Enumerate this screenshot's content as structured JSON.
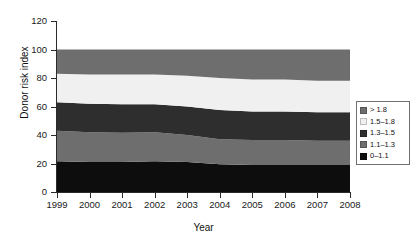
{
  "chart_data": {
    "type": "area",
    "title": "",
    "subtitle": "",
    "xlabel": "Year",
    "ylabel": "Donor risk index",
    "xlim": [
      1999,
      2008
    ],
    "ylim": [
      0,
      120
    ],
    "yticks": [
      0,
      20,
      40,
      60,
      80,
      100,
      120
    ],
    "xticks": [
      1999,
      2000,
      2001,
      2002,
      2003,
      2004,
      2005,
      2006,
      2007,
      2008
    ],
    "grid": false,
    "stacked": true,
    "stack_order": "bottom-to-top",
    "legend_position": "right",
    "x": [
      1999,
      2000,
      2001,
      2002,
      2003,
      2004,
      2005,
      2006,
      2007,
      2008
    ],
    "series": [
      {
        "name": "0–1.1",
        "color": "#0d0d0d",
        "values": [
          21.5,
          21.0,
          21.0,
          21.5,
          21.0,
          19.5,
          19.0,
          19.0,
          19.0,
          19.0
        ]
      },
      {
        "name": "1.1–1.3",
        "color": "#6e6e6e",
        "values": [
          21.5,
          21.0,
          20.5,
          20.5,
          19.0,
          17.5,
          17.5,
          17.5,
          17.0,
          17.0
        ]
      },
      {
        "name": "1.3–1.5",
        "color": "#2e2e2e",
        "values": [
          20.0,
          20.0,
          20.0,
          19.5,
          20.0,
          20.5,
          20.0,
          20.0,
          20.0,
          20.0
        ]
      },
      {
        "name": "1.5–1.8",
        "color": "#f0f0f0",
        "values": [
          20.0,
          20.5,
          21.0,
          21.0,
          21.5,
          22.5,
          22.5,
          22.5,
          22.0,
          22.0
        ]
      },
      {
        "name": "> 1.8",
        "color": "#6e6e6e",
        "values": [
          17.0,
          17.5,
          17.5,
          17.5,
          18.5,
          20.0,
          21.0,
          21.0,
          22.0,
          22.0
        ]
      }
    ],
    "cumulative_tops": {
      "0–1.1": [
        21.5,
        21.0,
        21.0,
        21.5,
        21.0,
        19.5,
        19.0,
        19.0,
        19.0,
        19.0
      ],
      "1.1–1.3": [
        43.0,
        42.0,
        41.5,
        42.0,
        40.0,
        37.0,
        36.5,
        36.5,
        36.0,
        36.0
      ],
      "1.3–1.5": [
        63.0,
        62.0,
        61.5,
        61.5,
        60.0,
        57.5,
        56.5,
        56.5,
        56.0,
        56.0
      ],
      "1.5–1.8": [
        83.0,
        82.5,
        82.5,
        82.5,
        81.5,
        80.0,
        79.0,
        79.0,
        78.0,
        78.0
      ],
      "> 1.8": [
        100,
        100,
        100,
        100,
        100,
        100,
        100,
        100,
        100,
        100
      ]
    }
  },
  "axes": {
    "ylabel": "Donor risk index",
    "xlabel": "Year",
    "ytick_labels": [
      "0",
      "20",
      "40",
      "60",
      "80",
      "100",
      "120"
    ],
    "xtick_labels": [
      "1999",
      "2000",
      "2001",
      "2002",
      "2003",
      "2004",
      "2005",
      "2006",
      "2007",
      "2008"
    ]
  },
  "legend": {
    "items": [
      {
        "label": "> 1.8",
        "color": "#6e6e6e"
      },
      {
        "label": "1.5–1.8",
        "color": "#f0f0f0"
      },
      {
        "label": "1.3–1.5",
        "color": "#2e2e2e"
      },
      {
        "label": "1.1–1.3",
        "color": "#6e6e6e"
      },
      {
        "label": "0–1.1",
        "color": "#0d0d0d"
      }
    ]
  }
}
